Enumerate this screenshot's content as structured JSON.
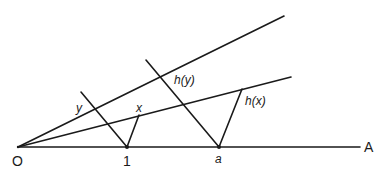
{
  "diagram": {
    "type": "geometric construction",
    "points": {
      "origin": {
        "label": "O",
        "x": 18,
        "y": 147
      },
      "one": {
        "label": "1",
        "x": 127,
        "y": 147
      },
      "a": {
        "label": "a",
        "x": 219,
        "y": 147
      },
      "x": {
        "label": "x",
        "x": 139,
        "y": 115
      },
      "hx": {
        "label": "h(x)",
        "x": 242,
        "y": 89
      },
      "y": {
        "label": "y"
      },
      "hy": {
        "label": "h(y)"
      },
      "axis_end": {
        "label": "A"
      }
    },
    "labels": {
      "O": "O",
      "one": "1",
      "a": "a",
      "A": "A",
      "x": "x",
      "y": "y",
      "hx": "h(x)",
      "hy": "h(y)"
    },
    "lines": [
      {
        "name": "baseline-OA",
        "from": [
          18,
          147
        ],
        "to": [
          360,
          147
        ]
      },
      {
        "name": "upper-ray",
        "from": [
          18,
          147
        ],
        "to": [
          284,
          16
        ]
      },
      {
        "name": "lower-ray",
        "from": [
          18,
          147
        ],
        "to": [
          291,
          77
        ]
      },
      {
        "name": "line-through-1",
        "from": [
          81,
          92
        ],
        "to": [
          127,
          147
        ]
      },
      {
        "name": "segment-1-x",
        "from": [
          127,
          147
        ],
        "to": [
          139,
          115
        ]
      },
      {
        "name": "line-through-a",
        "from": [
          146,
          60
        ],
        "to": [
          219,
          147
        ]
      },
      {
        "name": "segment-a-hx",
        "from": [
          219,
          147
        ],
        "to": [
          242,
          89
        ]
      }
    ],
    "color": "#1a1a1a"
  }
}
